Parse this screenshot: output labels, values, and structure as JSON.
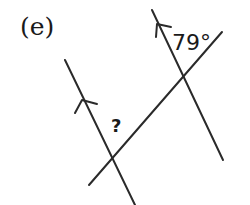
{
  "diagram": {
    "part_label": "(e)",
    "angles": {
      "known": "79°",
      "unknown": "?"
    },
    "lines": {
      "left_parallel": {
        "x1": 65,
        "y1": 60,
        "x2": 135,
        "y2": 205,
        "arrow": true
      },
      "right_parallel": {
        "x1": 152,
        "y1": 10,
        "x2": 223,
        "y2": 160,
        "arrow": true
      },
      "transversal": {
        "x1": 89,
        "y1": 185,
        "x2": 222,
        "y2": 32
      }
    },
    "colors": {
      "stroke": "#2a2a2a",
      "text": "#1a1a1a",
      "background": "#ffffff"
    }
  }
}
